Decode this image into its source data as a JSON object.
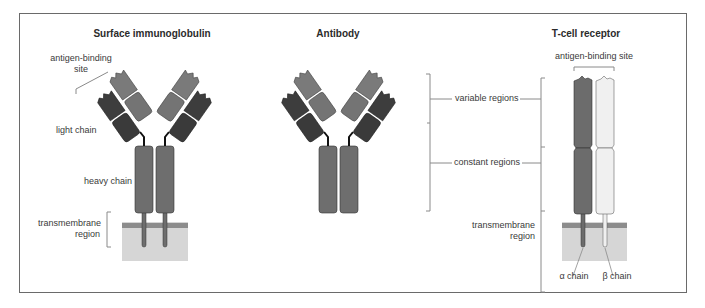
{
  "panels": {
    "surface_ig": {
      "title": "Surface immunoglobulin",
      "labels": {
        "antigen_binding_site_line1": "antigen-binding",
        "antigen_binding_site_line2": "site",
        "light_chain": "light chain",
        "heavy_chain": "heavy chain",
        "transmembrane_line1": "transmembrane",
        "transmembrane_line2": "region"
      }
    },
    "antibody": {
      "title": "Antibody"
    },
    "tcr": {
      "title": "T-cell receptor",
      "labels": {
        "antigen_binding_site": "antigen-binding site",
        "transmembrane_line1": "transmembrane",
        "transmembrane_line2": "region",
        "alpha_chain": "α chain",
        "beta_chain": "β chain"
      }
    }
  },
  "region_labels": {
    "variable": "variable regions",
    "constant": "constant regions"
  },
  "colors": {
    "light_chain": "#3d3d3d",
    "heavy_chain_variable": "#7a7a7a",
    "heavy_chain_constant": "#6e6e6e",
    "alpha_chain": "#6c6c6c",
    "beta_chain": "#f0f0f0",
    "membrane_band": "#8c8c8c",
    "membrane_fill": "#d6d6d6",
    "frame": "#6a6a6a",
    "bracket": "#8a8a8a"
  }
}
